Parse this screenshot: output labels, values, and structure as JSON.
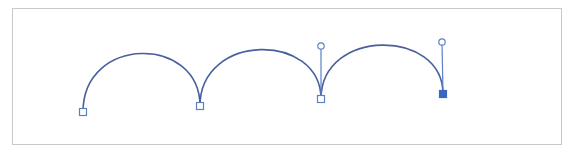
{
  "diagram": {
    "type": "bezier-path-editing",
    "frame": {
      "x": 12,
      "y": 8,
      "width": 549,
      "height": 136,
      "stroke": "#c8c8c8"
    },
    "path_color": "#4a5f9c",
    "handle_color": "#5b80c8",
    "anchor_fill_selected": "#3a66c4",
    "anchor_fill_unselected": "#ffffff",
    "anchors": [
      {
        "id": "anchor-1",
        "x": 83,
        "y": 112,
        "selected": false
      },
      {
        "id": "anchor-2",
        "x": 200,
        "y": 106,
        "selected": false
      },
      {
        "id": "anchor-3",
        "x": 321,
        "y": 99,
        "selected": false
      },
      {
        "id": "anchor-4",
        "x": 443,
        "y": 94,
        "selected": true
      }
    ],
    "handles": [
      {
        "id": "handle-anchor-3",
        "anchor": "anchor-3",
        "x": 321,
        "y": 46
      },
      {
        "id": "handle-anchor-4",
        "anchor": "anchor-4",
        "x": 442,
        "y": 42
      }
    ],
    "segments": [
      {
        "id": "segment-1",
        "d": "M83,112 C83,35 200,35 200,106"
      },
      {
        "id": "segment-2",
        "d": "M200,106 C200,32 321,32 321,99"
      },
      {
        "id": "segment-3",
        "d": "M321,99 C321,28 443,28 443,94"
      }
    ]
  }
}
